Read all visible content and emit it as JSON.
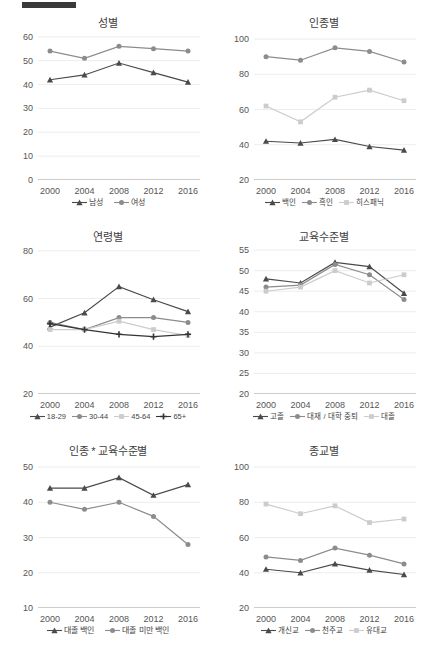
{
  "document": {
    "redaction_bar": "redacted-text"
  },
  "shared": {
    "x_categories": [
      "2000",
      "2004",
      "2008",
      "2012",
      "2016"
    ],
    "colors": {
      "dark": "#4a4a4a",
      "mid": "#848484",
      "light": "#c9c9c9",
      "darkest": "#343434",
      "axis": "#9a9a9a",
      "grid": "#ededed"
    }
  },
  "charts": [
    {
      "id": "gender",
      "title": "성별",
      "chart_data": {
        "type": "line",
        "title": "성별",
        "xlabel": "",
        "ylabel": "",
        "categories": [
          "2000",
          "2004",
          "2008",
          "2012",
          "2016"
        ],
        "yticks": [
          0,
          10,
          20,
          30,
          40,
          50,
          60
        ],
        "ylim": [
          0,
          62
        ],
        "grid": true,
        "legend_position": "bottom",
        "series": [
          {
            "name": "남성",
            "marker": "triangle",
            "color": "#4a4a4a",
            "values": [
              42,
              44,
              49,
              45,
              41
            ]
          },
          {
            "name": "여성",
            "marker": "circle",
            "color": "#8c8c8c",
            "values": [
              54,
              51,
              56,
              55,
              54
            ]
          }
        ]
      }
    },
    {
      "id": "race",
      "title": "인종별",
      "chart_data": {
        "type": "line",
        "title": "인종별",
        "xlabel": "",
        "ylabel": "",
        "categories": [
          "2000",
          "2004",
          "2008",
          "2012",
          "2016"
        ],
        "yticks": [
          20,
          40,
          60,
          80,
          100
        ],
        "ylim": [
          20,
          104
        ],
        "grid": true,
        "legend_position": "bottom",
        "series": [
          {
            "name": "백인",
            "marker": "triangle",
            "color": "#4a4a4a",
            "values": [
              42,
              41,
              43,
              39,
              37
            ]
          },
          {
            "name": "흑인",
            "marker": "circle",
            "color": "#8c8c8c",
            "values": [
              90,
              88,
              95,
              93,
              87
            ]
          },
          {
            "name": "히스패닉",
            "marker": "square",
            "color": "#cccccc",
            "values": [
              62,
              53,
              67,
              71,
              65
            ]
          }
        ]
      }
    },
    {
      "id": "age",
      "title": "연령별",
      "chart_data": {
        "type": "line",
        "title": "연령별",
        "xlabel": "",
        "ylabel": "",
        "categories": [
          "2000",
          "2004",
          "2008",
          "2012",
          "2016"
        ],
        "yticks": [
          20,
          40,
          60,
          80
        ],
        "ylim": [
          20,
          82
        ],
        "grid": true,
        "legend_position": "bottom",
        "series": [
          {
            "name": "18-29",
            "marker": "triangle",
            "color": "#4a4a4a",
            "values": [
              48,
              54,
              65,
              59.5,
              54.5
            ]
          },
          {
            "name": "30-44",
            "marker": "circle",
            "color": "#8c8c8c",
            "values": [
              50,
              47,
              52,
              52,
              50
            ]
          },
          {
            "name": "45-64",
            "marker": "square",
            "color": "#cccccc",
            "values": [
              47,
              47,
              50.5,
              47,
              44.5
            ]
          },
          {
            "name": "65+",
            "marker": "plus",
            "color": "#343434",
            "values": [
              49.5,
              47,
              45,
              44,
              45
            ]
          }
        ]
      }
    },
    {
      "id": "education",
      "title": "교육수준별",
      "chart_data": {
        "type": "line",
        "title": "교육수준별",
        "xlabel": "",
        "ylabel": "",
        "categories": [
          "2000",
          "2004",
          "2008",
          "2012",
          "2016"
        ],
        "yticks": [
          20,
          25,
          30,
          35,
          40,
          45,
          50,
          55
        ],
        "ylim": [
          20,
          56
        ],
        "grid": true,
        "legend_position": "bottom",
        "series": [
          {
            "name": "고졸",
            "marker": "triangle",
            "color": "#4a4a4a",
            "values": [
              48,
              47,
              52,
              51,
              44.5
            ]
          },
          {
            "name": "대재 / 대학 중퇴",
            "marker": "circle",
            "color": "#8c8c8c",
            "values": [
              46,
              46.5,
              51.5,
              49,
              43
            ]
          },
          {
            "name": "대졸",
            "marker": "square",
            "color": "#cccccc",
            "values": [
              45,
              46,
              50,
              47,
              49
            ]
          }
        ]
      }
    },
    {
      "id": "race-education",
      "title": "인종 * 교육수준별",
      "chart_data": {
        "type": "line",
        "title": "인종 * 교육수준별",
        "xlabel": "",
        "ylabel": "",
        "categories": [
          "2000",
          "2004",
          "2008",
          "2012",
          "2016"
        ],
        "yticks": [
          10,
          20,
          30,
          40,
          50
        ],
        "ylim": [
          10,
          52
        ],
        "grid": true,
        "legend_position": "bottom",
        "series": [
          {
            "name": "대졸 백인",
            "marker": "triangle",
            "color": "#4a4a4a",
            "values": [
              44,
              44,
              47,
              42,
              45
            ]
          },
          {
            "name": "대졸 미만 백인",
            "marker": "circle",
            "color": "#8c8c8c",
            "values": [
              40,
              38,
              40,
              36,
              28
            ]
          }
        ]
      }
    },
    {
      "id": "religion",
      "title": "종교별",
      "chart_data": {
        "type": "line",
        "title": "종교별",
        "xlabel": "",
        "ylabel": "",
        "categories": [
          "2000",
          "2004",
          "2008",
          "2012",
          "2016"
        ],
        "yticks": [
          20,
          40,
          60,
          80,
          100
        ],
        "ylim": [
          20,
          104
        ],
        "grid": true,
        "legend_position": "bottom",
        "series": [
          {
            "name": "개신교",
            "marker": "triangle",
            "color": "#4a4a4a",
            "values": [
              42,
              40,
              45,
              41.5,
              39
            ]
          },
          {
            "name": "천주교",
            "marker": "circle",
            "color": "#8c8c8c",
            "values": [
              49,
              47,
              54,
              50,
              45
            ]
          },
          {
            "name": "유대교",
            "marker": "square",
            "color": "#cccccc",
            "values": [
              79,
              73.5,
              78,
              68.5,
              70.5
            ]
          }
        ]
      }
    }
  ]
}
